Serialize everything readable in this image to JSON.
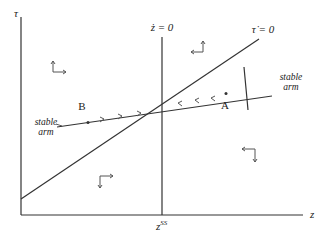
{
  "diagram": {
    "type": "phase-diagram",
    "axes": {
      "y_label": "τ",
      "x_label": "z",
      "x_tick_label": "z",
      "x_tick_superscript": "SS"
    },
    "loci": {
      "z_dot_zero": "ż = 0",
      "tau_dot_zero": "τ̇ = 0"
    },
    "points": {
      "A": "A",
      "B": "B"
    },
    "stable_arm_labels": {
      "left": {
        "line1": "stable",
        "line2": "arm"
      },
      "right": {
        "line1": "stable",
        "line2": "arm"
      }
    },
    "colors": {
      "line": "#333333",
      "text": "#222222",
      "background": "#ffffff"
    }
  }
}
